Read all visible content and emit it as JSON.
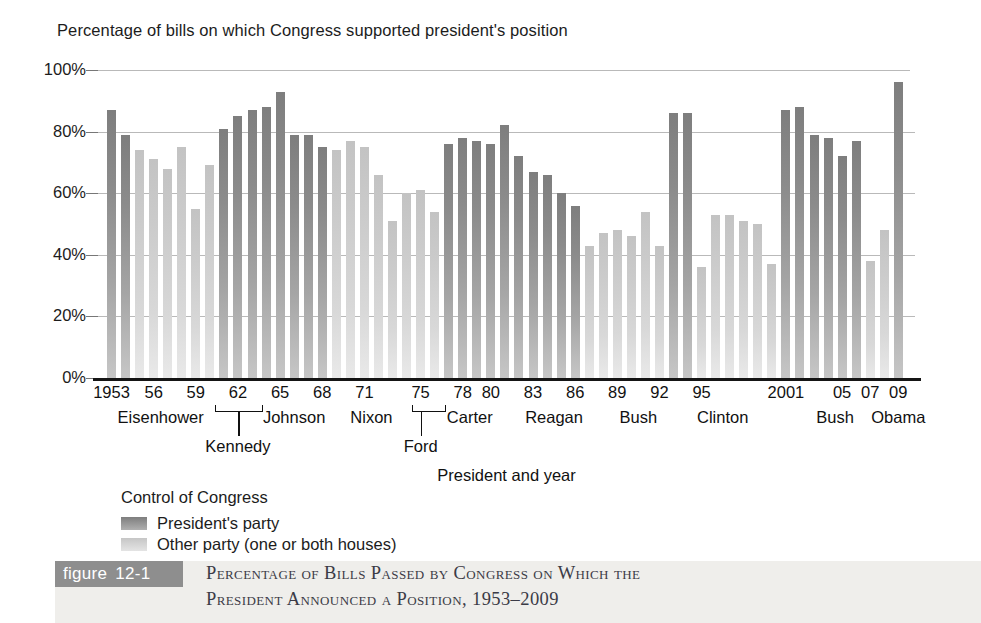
{
  "axis_title": "Percentage of bills on which Congress supported president's position",
  "xaxis_caption": "President and year",
  "legend": {
    "title": "Control of Congress",
    "items": [
      {
        "key": "dem",
        "label": "President's party"
      },
      {
        "key": "other",
        "label": "Other party (one or both houses)"
      }
    ]
  },
  "figure": {
    "tag_word": "figure",
    "tag_number": "12-1",
    "caption_line1": "Percentage of Bills Passed by Congress on Which the",
    "caption_line2": "President Announced a Position, 1953–2009"
  },
  "colors": {
    "presidents_party": "#8b8b8b",
    "other_party": "#d2d2d2",
    "gridline": "#b9b9b9",
    "axis": "#151515",
    "figure_tag_bg": "#8e8e8e",
    "figure_band_bg": "#efeeeb"
  },
  "year_ticks": [
    "1953",
    "56",
    "59",
    "62",
    "65",
    "68",
    "71",
    "75",
    "78",
    "80",
    "83",
    "86",
    "89",
    "92",
    "95",
    "2001",
    "05",
    "07",
    "09"
  ],
  "presidents_row1": [
    "Eisenhower",
    "Johnson",
    "Nixon",
    "Carter",
    "Reagan",
    "Bush",
    "Clinton",
    "Bush",
    "Obama"
  ],
  "presidents_row2": [
    "Kennedy",
    "Ford"
  ],
  "chart_data": {
    "type": "bar",
    "title": "Percentage of Bills Passed by Congress on Which the President Announced a Position, 1953–2009",
    "xlabel": "President and year",
    "ylabel": "Percentage of bills on which Congress supported president's position",
    "ylim": [
      0,
      100
    ],
    "ytick_labels": [
      "0%",
      "20%",
      "40%",
      "60%",
      "80%",
      "100%"
    ],
    "ytick_values": [
      0,
      20,
      40,
      60,
      80,
      100
    ],
    "grid": true,
    "legend_position": "below-left",
    "series_names": [
      "President's party",
      "Other party (one or both houses)"
    ],
    "x": [
      1953,
      1954,
      1955,
      1956,
      1957,
      1958,
      1959,
      1960,
      1961,
      1962,
      1963,
      1964,
      1965,
      1966,
      1967,
      1968,
      1969,
      1970,
      1971,
      1972,
      1973,
      1974,
      1975,
      1976,
      1977,
      1978,
      1979,
      1980,
      1981,
      1982,
      1983,
      1984,
      1985,
      1986,
      1987,
      1988,
      1989,
      1990,
      1991,
      1992,
      1993,
      1994,
      1995,
      1996,
      1997,
      1998,
      1999,
      2000,
      2001,
      2002,
      2003,
      2004,
      2005,
      2006,
      2007,
      2008,
      2009
    ],
    "values": [
      87,
      79,
      74,
      71,
      68,
      75,
      55,
      69,
      81,
      85,
      87,
      88,
      93,
      79,
      79,
      75,
      74,
      77,
      75,
      66,
      51,
      60,
      61,
      54,
      76,
      78,
      77,
      76,
      82,
      72,
      67,
      66,
      60,
      56,
      43,
      47,
      48,
      46,
      54,
      43,
      86,
      86,
      36,
      53,
      53,
      51,
      50,
      37,
      87,
      88,
      79,
      78,
      72,
      77,
      38,
      48,
      96
    ],
    "party_control": [
      "dem",
      "dem",
      "other",
      "other",
      "other",
      "other",
      "other",
      "other",
      "dem",
      "dem",
      "dem",
      "dem",
      "dem",
      "dem",
      "dem",
      "dem",
      "other",
      "other",
      "other",
      "other",
      "other",
      "other",
      "other",
      "other",
      "dem",
      "dem",
      "dem",
      "dem",
      "dem",
      "dem",
      "dem",
      "dem",
      "dem",
      "dem",
      "other",
      "other",
      "other",
      "other",
      "other",
      "other",
      "dem",
      "dem",
      "other",
      "other",
      "other",
      "other",
      "other",
      "other",
      "dem",
      "dem",
      "dem",
      "dem",
      "dem",
      "dem",
      "other",
      "other",
      "dem"
    ],
    "president_by_year": [
      "Eisenhower",
      "Eisenhower",
      "Eisenhower",
      "Eisenhower",
      "Eisenhower",
      "Eisenhower",
      "Eisenhower",
      "Eisenhower",
      "Kennedy",
      "Kennedy",
      "Kennedy",
      "Johnson",
      "Johnson",
      "Johnson",
      "Johnson",
      "Johnson",
      "Nixon",
      "Nixon",
      "Nixon",
      "Nixon",
      "Nixon",
      "Nixon",
      "Ford",
      "Ford",
      "Carter",
      "Carter",
      "Carter",
      "Carter",
      "Reagan",
      "Reagan",
      "Reagan",
      "Reagan",
      "Reagan",
      "Reagan",
      "Reagan",
      "Reagan",
      "Bush",
      "Bush",
      "Bush",
      "Bush",
      "Clinton",
      "Clinton",
      "Clinton",
      "Clinton",
      "Clinton",
      "Clinton",
      "Clinton",
      "Clinton",
      "Bush",
      "Bush",
      "Bush",
      "Bush",
      "Bush",
      "Bush",
      "Bush",
      "Bush",
      "Obama"
    ]
  }
}
